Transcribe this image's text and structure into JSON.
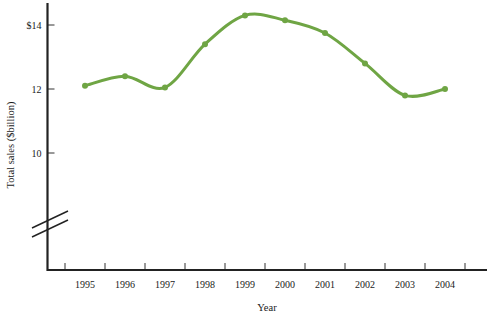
{
  "chart_data": {
    "type": "line",
    "title": "",
    "xlabel": "Year",
    "ylabel": "Total sales ($billion)",
    "categories": [
      "1995",
      "1996",
      "1997",
      "1998",
      "1999",
      "2000",
      "2001",
      "2002",
      "2003",
      "2004"
    ],
    "values": [
      12.1,
      12.4,
      12.05,
      13.4,
      14.3,
      14.15,
      13.75,
      12.8,
      11.8,
      12.0
    ],
    "series": [
      {
        "name": "Total sales",
        "values": [
          12.1,
          12.4,
          12.05,
          13.4,
          14.3,
          14.15,
          13.75,
          12.8,
          11.8,
          12.0
        ]
      }
    ],
    "y_tick_labels": [
      "$14",
      "12",
      "10"
    ],
    "y_tick_values": [
      14,
      12,
      10
    ],
    "ylim": [
      9.2,
      14.8
    ],
    "xlim": [
      "1994.5",
      "2004.8"
    ],
    "grid": false,
    "legend": "none",
    "axis_break": true,
    "axis_break_note": "y-axis broken below 10",
    "line_color": "#6fa544",
    "marker_color": "#6fa544",
    "axis_color": "#222222",
    "background_color": "#ffffff"
  },
  "axes": {
    "y_axis_title": "Total sales ($billion)",
    "x_axis_title": "Year",
    "y_ticks": [
      {
        "label": "$14",
        "value": 14
      },
      {
        "label": "12",
        "value": 12
      },
      {
        "label": "10",
        "value": 10
      }
    ],
    "x_ticks": [
      {
        "label": "1995",
        "value": 1995
      },
      {
        "label": "1996",
        "value": 1996
      },
      {
        "label": "1997",
        "value": 1997
      },
      {
        "label": "1998",
        "value": 1998
      },
      {
        "label": "1999",
        "value": 1999
      },
      {
        "label": "2000",
        "value": 2000
      },
      {
        "label": "2001",
        "value": 2001
      },
      {
        "label": "2002",
        "value": 2002
      },
      {
        "label": "2003",
        "value": 2003
      },
      {
        "label": "2004",
        "value": 2004
      }
    ]
  }
}
